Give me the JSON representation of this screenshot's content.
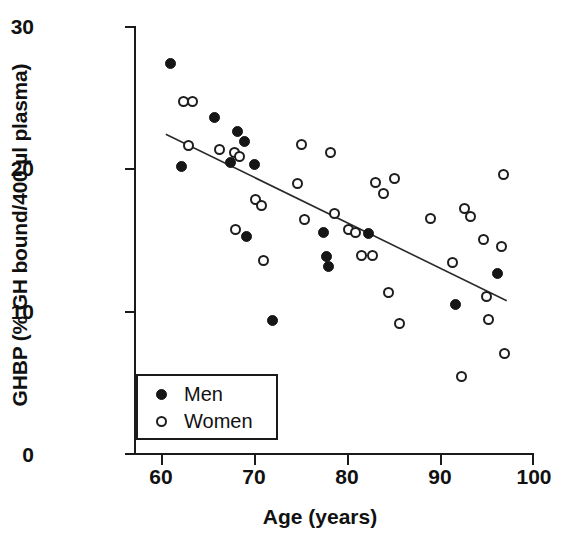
{
  "chart_data": {
    "type": "scatter",
    "title": "",
    "xlabel": "Age (years)",
    "ylabel": "GHBP (% GH bound/400 µl plasma)",
    "xlim": [
      56,
      100
    ],
    "ylim": [
      0,
      30
    ],
    "xticks": [
      60,
      70,
      80,
      90,
      100
    ],
    "yticks": [
      0,
      10,
      20,
      30
    ],
    "grid": false,
    "legend_position": "lower-left-inside",
    "series": [
      {
        "name": "Men",
        "marker": "filled-circle",
        "color": "#161616",
        "points": [
          [
            60.0,
            27.4
          ],
          [
            61.2,
            20.1
          ],
          [
            64.8,
            23.6
          ],
          [
            66.6,
            20.4
          ],
          [
            67.4,
            22.6
          ],
          [
            68.2,
            21.9
          ],
          [
            68.4,
            15.2
          ],
          [
            69.2,
            20.3
          ],
          [
            71.2,
            9.3
          ],
          [
            76.8,
            15.5
          ],
          [
            77.2,
            13.8
          ],
          [
            77.4,
            13.1
          ],
          [
            81.8,
            15.4
          ],
          [
            91.4,
            10.4
          ],
          [
            96.0,
            12.6
          ]
        ]
      },
      {
        "name": "Women",
        "marker": "open-circle",
        "color": "#ffffff",
        "points": [
          [
            61.4,
            24.7
          ],
          [
            62.4,
            24.7
          ],
          [
            62.0,
            21.6
          ],
          [
            65.4,
            21.3
          ],
          [
            67.0,
            21.1
          ],
          [
            67.6,
            20.8
          ],
          [
            67.2,
            15.7
          ],
          [
            69.4,
            17.8
          ],
          [
            70.0,
            17.4
          ],
          [
            70.2,
            13.5
          ],
          [
            74.4,
            21.7
          ],
          [
            74.0,
            18.9
          ],
          [
            74.8,
            16.4
          ],
          [
            77.6,
            21.1
          ],
          [
            78.0,
            16.8
          ],
          [
            79.6,
            15.7
          ],
          [
            80.4,
            15.5
          ],
          [
            81.0,
            13.9
          ],
          [
            82.6,
            19.0
          ],
          [
            83.4,
            18.2
          ],
          [
            82.2,
            13.9
          ],
          [
            84.6,
            19.3
          ],
          [
            84.0,
            11.3
          ],
          [
            85.2,
            9.1
          ],
          [
            88.6,
            16.5
          ],
          [
            91.0,
            13.4
          ],
          [
            92.4,
            17.2
          ],
          [
            93.0,
            16.6
          ],
          [
            92.0,
            5.4
          ],
          [
            94.4,
            15.0
          ],
          [
            94.8,
            11.0
          ],
          [
            95.0,
            9.4
          ],
          [
            96.6,
            19.6
          ],
          [
            96.4,
            14.5
          ],
          [
            96.8,
            7.0
          ]
        ]
      }
    ],
    "trendline": {
      "name": "regression-line",
      "x_start": 59.5,
      "y_start": 22.4,
      "x_end": 97.0,
      "y_end": 10.7
    }
  },
  "legend": {
    "entries": [
      {
        "label": "Men",
        "marker": "filled-circle"
      },
      {
        "label": "Women",
        "marker": "open-circle"
      }
    ]
  },
  "axes": {
    "x_tick_labels": [
      "60",
      "70",
      "80",
      "90",
      "100"
    ],
    "y_tick_labels": [
      "30",
      "20",
      "10",
      "0"
    ],
    "x_title": "Age (years)",
    "y_title": "GHBP (% GH bound/400 µl plasma)"
  }
}
